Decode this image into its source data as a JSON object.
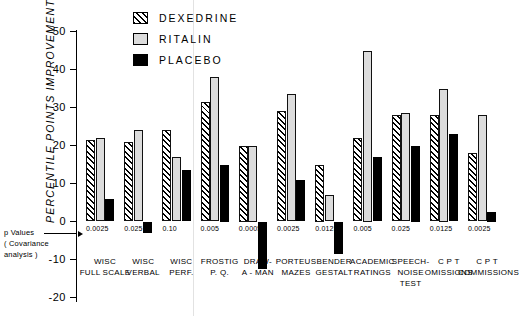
{
  "chart_data": {
    "type": "bar",
    "title": "",
    "xlabel": "",
    "ylabel": "PERCENTILE POINTS IMPROVEMENT",
    "ylim": [
      -20,
      50
    ],
    "yticks": [
      -20,
      -10,
      0,
      10,
      20,
      30,
      40,
      50
    ],
    "ytick_labels": [
      "-20",
      "-10",
      "0",
      "10",
      "20",
      "30",
      "40",
      "50"
    ],
    "grid": false,
    "legend_position": "top-center",
    "categories": [
      "WISC\nFULL SCALE",
      "WISC\nVERBAL",
      "WISC\nPERF.",
      "FROSTIG\nP. Q.",
      "DRAW-\nA - MAN",
      "PORTEUS\nMAZES",
      "BENDER\nGESTALT",
      "ACADEMIC\nRATINGS",
      "SPEECH-\nNOISE\nTEST",
      "C P T\nOMISSIONS",
      "C P T\nCOMMISSIONS"
    ],
    "series": [
      {
        "name": "DEXEDRINE",
        "values": [
          21.5,
          21,
          24,
          31.5,
          20,
          29,
          15,
          22,
          28,
          28,
          18
        ]
      },
      {
        "name": "RITALIN",
        "values": [
          22,
          24,
          17,
          38,
          20,
          33.5,
          7,
          45,
          28.5,
          35,
          28
        ]
      },
      {
        "name": "PLACEBO",
        "values": [
          6,
          -3,
          13.5,
          15,
          -12.5,
          11,
          -8.5,
          17,
          20,
          23,
          2.5
        ]
      }
    ],
    "annotations": {
      "p_values_label": "p Values",
      "p_values_sub1": "( Covariance",
      "p_values_sub2": "analysis )",
      "p_values": [
        "0.0025",
        "0.025",
        "0.10",
        "0.005",
        "0.0005",
        "0.0025",
        "0.0125",
        "0.005",
        "0.025",
        "0.0125",
        "0.0025"
      ]
    },
    "colors": {
      "dexedrine": "#000000",
      "ritalin": "#dcdcdc",
      "placebo": "#000000",
      "axis": "#000000",
      "background": "#ffffff"
    }
  },
  "legend": {
    "items": [
      {
        "label": "DEXEDRINE",
        "swatch": "hatched"
      },
      {
        "label": "RITALIN",
        "swatch": "light-gray"
      },
      {
        "label": "PLACEBO",
        "swatch": "solid-black"
      }
    ]
  },
  "axis": {
    "y_title": "PERCENTILE POINTS IMPROVEMENT"
  }
}
